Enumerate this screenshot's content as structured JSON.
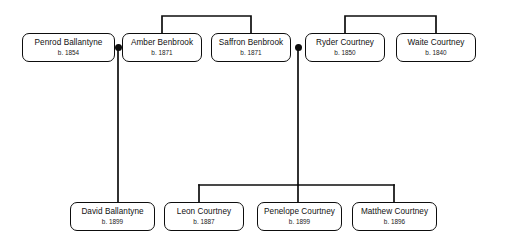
{
  "diagram": {
    "type": "family-tree",
    "line_color": "#0d0d0d",
    "node_fill": "#ffffff",
    "node_border": "#0d0d0d",
    "canvas": {
      "width": 505,
      "height": 246
    }
  },
  "people": [
    {
      "id": "penrod",
      "name": "Penrod Ballantyne",
      "birth": "b. 1854",
      "x": 22,
      "y": 33,
      "w": 93,
      "h": 29
    },
    {
      "id": "amber",
      "name": "Amber Benbrook",
      "birth": "b. 1871",
      "x": 122,
      "y": 33,
      "w": 80,
      "h": 29
    },
    {
      "id": "saffron",
      "name": "Saffron Benbrook",
      "birth": "b. 1871",
      "x": 211,
      "y": 33,
      "w": 80,
      "h": 29
    },
    {
      "id": "ryder",
      "name": "Ryder Courtney",
      "birth": "b. 1850",
      "x": 305,
      "y": 33,
      "w": 80,
      "h": 29
    },
    {
      "id": "waite",
      "name": "Waite Courtney",
      "birth": "b. 1840",
      "x": 396,
      "y": 33,
      "w": 80,
      "h": 29
    },
    {
      "id": "david",
      "name": "David Ballantyne",
      "birth": "b. 1899",
      "x": 70,
      "y": 202,
      "w": 85,
      "h": 29
    },
    {
      "id": "leon",
      "name": "Leon Courtney",
      "birth": "b. 1887",
      "x": 164,
      "y": 202,
      "w": 80,
      "h": 29
    },
    {
      "id": "penelope",
      "name": "Penelope Courtney",
      "birth": "b. 1899",
      "x": 257,
      "y": 202,
      "w": 85,
      "h": 29
    },
    {
      "id": "matthew",
      "name": "Matthew Courtney",
      "birth": "b. 1896",
      "x": 352,
      "y": 202,
      "w": 85,
      "h": 29
    }
  ],
  "unions": [
    {
      "id": "union-penrod-amber",
      "x": 118,
      "y": 47,
      "partners": [
        "Penrod Ballantyne",
        "Amber Benbrook"
      ],
      "children": [
        "David Ballantyne"
      ]
    },
    {
      "id": "union-saffron-ryder",
      "x": 298,
      "y": 47,
      "partners": [
        "Saffron Benbrook",
        "Ryder Courtney"
      ],
      "children": [
        "Leon Courtney",
        "Penelope Courtney",
        "Matthew Courtney"
      ]
    }
  ],
  "sibling_groups": [
    {
      "id": "benbrook-siblings",
      "members": [
        "Amber Benbrook",
        "Saffron Benbrook"
      ]
    },
    {
      "id": "courtney-siblings",
      "members": [
        "Ryder Courtney",
        "Waite Courtney"
      ]
    }
  ]
}
